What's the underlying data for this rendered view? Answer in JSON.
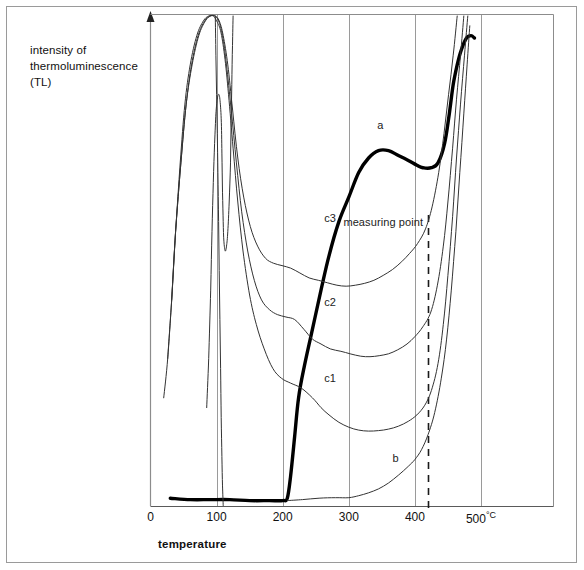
{
  "figure": {
    "y_axis_label": "intensity of\nthermoluminescence\n(TL)",
    "y_axis_label_lines": [
      "intensity of",
      "thermoluminescence",
      "(TL)"
    ],
    "x_axis_label": "temperature",
    "annotation_measuring_point": "measuring point",
    "unit_suffix": "°C"
  },
  "ticks": {
    "t0": "0",
    "t100": "100",
    "t200": "200",
    "t300": "300",
    "t400": "400",
    "t500": "500",
    "t500_unit": "°C"
  },
  "curve_labels": {
    "a": "a",
    "b": "b",
    "c1": "c1",
    "c2": "c2",
    "c3": "c3"
  },
  "colors": {
    "ink": "#111111",
    "curve": "#333333",
    "bold_curve": "#000000",
    "grid": "#9a9a9a",
    "frame": "#8c8c8c",
    "page_border": "#9a9a9a",
    "background": "#ffffff"
  },
  "chart_data": {
    "type": "line",
    "title": "",
    "xlabel": "temperature",
    "ylabel": "intensity of thermoluminescence (TL)",
    "xlim": [
      0,
      560
    ],
    "ylim": [
      0,
      100
    ],
    "x_ticks": [
      0,
      100,
      200,
      300,
      400,
      500
    ],
    "x_tick_labels": [
      "0",
      "100",
      "200",
      "300",
      "400",
      "500°C"
    ],
    "x_unit": "°C",
    "y_ticks": [],
    "grid": "vertical-only",
    "legend": "inline-curve-labels",
    "annotations": [
      {
        "text": "measuring point",
        "x": 420,
        "kind": "vertical-dashed-line",
        "label_x": 375,
        "label_y_frac": 0.42
      }
    ],
    "series": [
      {
        "name": "a",
        "style": "bold",
        "label_x": 352,
        "label_y": 76,
        "points": [
          [
            30,
            1.5
          ],
          [
            60,
            1.2
          ],
          [
            90,
            1.2
          ],
          [
            120,
            1.2
          ],
          [
            150,
            1.0
          ],
          [
            180,
            1.0
          ],
          [
            200,
            1.0
          ],
          [
            207,
            1.5
          ],
          [
            212,
            6
          ],
          [
            218,
            14
          ],
          [
            224,
            22
          ],
          [
            232,
            28
          ],
          [
            245,
            36
          ],
          [
            258,
            44
          ],
          [
            270,
            51
          ],
          [
            285,
            58
          ],
          [
            300,
            63
          ],
          [
            315,
            68
          ],
          [
            330,
            71
          ],
          [
            345,
            72.5
          ],
          [
            360,
            72.5
          ],
          [
            375,
            71.5
          ],
          [
            390,
            70.5
          ],
          [
            403,
            69.5
          ],
          [
            412,
            69
          ],
          [
            425,
            69
          ],
          [
            435,
            70
          ],
          [
            445,
            74
          ],
          [
            452,
            80
          ],
          [
            458,
            86
          ],
          [
            464,
            90
          ],
          [
            470,
            93
          ],
          [
            478,
            95.5
          ],
          [
            485,
            96
          ],
          [
            490,
            95.5
          ]
        ]
      },
      {
        "name": "b",
        "style": "thin",
        "label_x": 375,
        "label_y": 8,
        "points": [
          [
            207,
            1.0
          ],
          [
            230,
            1.2
          ],
          [
            255,
            1.5
          ],
          [
            280,
            1.6
          ],
          [
            300,
            1.6
          ],
          [
            315,
            2.0
          ],
          [
            330,
            2.6
          ],
          [
            345,
            3.4
          ],
          [
            360,
            4.6
          ],
          [
            375,
            6.2
          ],
          [
            390,
            8.0
          ],
          [
            400,
            9.4
          ],
          [
            410,
            11.4
          ],
          [
            420,
            14.5
          ],
          [
            430,
            19
          ],
          [
            440,
            26
          ],
          [
            448,
            34
          ],
          [
            455,
            44
          ],
          [
            462,
            56
          ],
          [
            468,
            68
          ],
          [
            474,
            80
          ],
          [
            479,
            90
          ],
          [
            483,
            98
          ]
        ]
      },
      {
        "name": "c1",
        "style": "thin",
        "label_x": 272,
        "label_y": 24.5,
        "points": [
          [
            20,
            22
          ],
          [
            26,
            30
          ],
          [
            32,
            42
          ],
          [
            38,
            56
          ],
          [
            45,
            70
          ],
          [
            52,
            82
          ],
          [
            60,
            90
          ],
          [
            70,
            96
          ],
          [
            80,
            99
          ],
          [
            88,
            100
          ],
          [
            95,
            100
          ],
          [
            100,
            99
          ],
          [
            106,
            97
          ],
          [
            112,
            92
          ],
          [
            118,
            84
          ],
          [
            125,
            73
          ],
          [
            132,
            62
          ],
          [
            140,
            52
          ],
          [
            150,
            43
          ],
          [
            160,
            37
          ],
          [
            172,
            32
          ],
          [
            185,
            28
          ],
          [
            198,
            26
          ],
          [
            212,
            25
          ],
          [
            228,
            24
          ],
          [
            245,
            22
          ],
          [
            258,
            20
          ],
          [
            270,
            18.5
          ],
          [
            285,
            17
          ],
          [
            300,
            16
          ],
          [
            315,
            15.4
          ],
          [
            330,
            15.2
          ],
          [
            345,
            15.3
          ],
          [
            360,
            15.6
          ],
          [
            375,
            16.2
          ],
          [
            390,
            17.2
          ],
          [
            403,
            18.5
          ],
          [
            415,
            20.5
          ],
          [
            425,
            23.5
          ],
          [
            435,
            29
          ],
          [
            443,
            37
          ],
          [
            450,
            47
          ],
          [
            457,
            59
          ],
          [
            463,
            71
          ],
          [
            469,
            82
          ],
          [
            475,
            92
          ],
          [
            480,
            100
          ]
        ]
      },
      {
        "name": "c2",
        "style": "thin",
        "label_x": 272,
        "label_y": 40,
        "points": [
          [
            26,
            30
          ],
          [
            32,
            42
          ],
          [
            38,
            56
          ],
          [
            46,
            70
          ],
          [
            54,
            82
          ],
          [
            62,
            90
          ],
          [
            72,
            96
          ],
          [
            82,
            99
          ],
          [
            90,
            100
          ],
          [
            97,
            100
          ],
          [
            103,
            99
          ],
          [
            109,
            96
          ],
          [
            115,
            90
          ],
          [
            122,
            81
          ],
          [
            130,
            70
          ],
          [
            138,
            60
          ],
          [
            147,
            52
          ],
          [
            157,
            46
          ],
          [
            168,
            42
          ],
          [
            180,
            40
          ],
          [
            192,
            39
          ],
          [
            205,
            38.5
          ],
          [
            218,
            38
          ],
          [
            232,
            36
          ],
          [
            245,
            34
          ],
          [
            258,
            33
          ],
          [
            272,
            32
          ],
          [
            288,
            31.5
          ],
          [
            302,
            31
          ],
          [
            318,
            30.5
          ],
          [
            332,
            30.4
          ],
          [
            346,
            30.6
          ],
          [
            360,
            31
          ],
          [
            374,
            31.8
          ],
          [
            388,
            33
          ],
          [
            400,
            34.5
          ],
          [
            412,
            36.5
          ],
          [
            424,
            39.5
          ],
          [
            434,
            45
          ],
          [
            443,
            53
          ],
          [
            450,
            62
          ],
          [
            457,
            73
          ],
          [
            463,
            83
          ],
          [
            469,
            92
          ],
          [
            474,
            100
          ]
        ]
      },
      {
        "name": "c3",
        "style": "thin",
        "label_x": 272,
        "label_y": 57,
        "points": [
          [
            32,
            42
          ],
          [
            38,
            56
          ],
          [
            46,
            70
          ],
          [
            54,
            82
          ],
          [
            63,
            90
          ],
          [
            73,
            96
          ],
          [
            83,
            99
          ],
          [
            91,
            100
          ],
          [
            98,
            100
          ],
          [
            104,
            99
          ],
          [
            110,
            96
          ],
          [
            117,
            90
          ],
          [
            124,
            81
          ],
          [
            132,
            71
          ],
          [
            141,
            63
          ],
          [
            151,
            57
          ],
          [
            162,
            53
          ],
          [
            174,
            50.5
          ],
          [
            186,
            49.5
          ],
          [
            199,
            49
          ],
          [
            212,
            48.5
          ],
          [
            226,
            47.5
          ],
          [
            240,
            46.5
          ],
          [
            254,
            46
          ],
          [
            268,
            45.5
          ],
          [
            282,
            45
          ],
          [
            296,
            44.8
          ],
          [
            310,
            45
          ],
          [
            324,
            45.4
          ],
          [
            338,
            46
          ],
          [
            352,
            47
          ],
          [
            366,
            48.2
          ],
          [
            380,
            49.8
          ],
          [
            392,
            51.5
          ],
          [
            404,
            53.5
          ],
          [
            416,
            56.5
          ],
          [
            426,
            61
          ],
          [
            436,
            68
          ],
          [
            444,
            76
          ],
          [
            451,
            84
          ],
          [
            458,
            92
          ],
          [
            464,
            100
          ]
        ]
      },
      {
        "name": "c0-inner-peak",
        "style": "thin",
        "points": [
          [
            85,
            20
          ],
          [
            88,
            30
          ],
          [
            91,
            44
          ],
          [
            93,
            56
          ],
          [
            95,
            66
          ],
          [
            97,
            74
          ],
          [
            99,
            80
          ],
          [
            101,
            83
          ],
          [
            103,
            84
          ],
          [
            105,
            83
          ],
          [
            107,
            79
          ],
          [
            108,
            72
          ],
          [
            109,
            64
          ],
          [
            110,
            58
          ],
          [
            111,
            54
          ],
          [
            113,
            52
          ],
          [
            115,
            53
          ],
          [
            117,
            56
          ],
          [
            119,
            62
          ],
          [
            121,
            70
          ],
          [
            122,
            78
          ],
          [
            123,
            86
          ],
          [
            124,
            94
          ],
          [
            125,
            100
          ]
        ]
      },
      {
        "name": "c0-left-flank",
        "style": "thin",
        "points": [
          [
            98,
            100
          ],
          [
            99,
            92
          ],
          [
            100,
            84
          ],
          [
            101,
            76
          ],
          [
            102,
            68
          ],
          [
            103,
            58
          ],
          [
            104,
            48
          ],
          [
            105,
            38
          ],
          [
            106,
            28
          ],
          [
            107,
            18
          ],
          [
            108,
            10
          ],
          [
            109,
            4
          ],
          [
            110,
            0
          ]
        ]
      }
    ]
  }
}
